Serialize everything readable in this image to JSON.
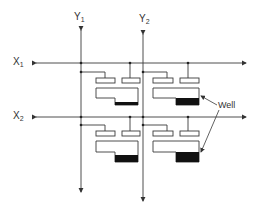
{
  "diagram": {
    "type": "memory-cell-array-schematic",
    "word_lines": [
      {
        "id": "X1",
        "label": "X",
        "subscript": "1"
      },
      {
        "id": "X2",
        "label": "X",
        "subscript": "2"
      }
    ],
    "bit_lines": [
      {
        "id": "Y1",
        "label": "Y",
        "subscript": "1"
      },
      {
        "id": "Y2",
        "label": "Y",
        "subscript": "2"
      }
    ],
    "cells": [
      {
        "row": 1,
        "col": 1,
        "well_fill": "partial"
      },
      {
        "row": 1,
        "col": 2,
        "well_fill": "full"
      },
      {
        "row": 2,
        "col": 1,
        "well_fill": "full"
      },
      {
        "row": 2,
        "col": 2,
        "well_fill": "full"
      }
    ],
    "annotation": {
      "label": "Well",
      "points_to": [
        "cell 1,2 well",
        "cell 2,2 well"
      ]
    },
    "colors": {
      "line": "#3a3a3a",
      "fill": "#111111",
      "background": "#ffffff"
    }
  }
}
